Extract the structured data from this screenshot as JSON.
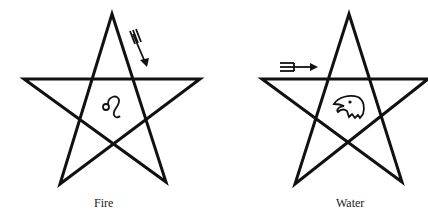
{
  "figures": [
    {
      "label": "Fire",
      "center_symbol": "leo-sign",
      "arrow": "trident-arrow-descending"
    },
    {
      "label": "Water",
      "center_symbol": "eagle-head",
      "arrow": "trident-arrow-horizontal"
    }
  ],
  "colors": {
    "line": "#111111",
    "background": "#ffffff"
  }
}
